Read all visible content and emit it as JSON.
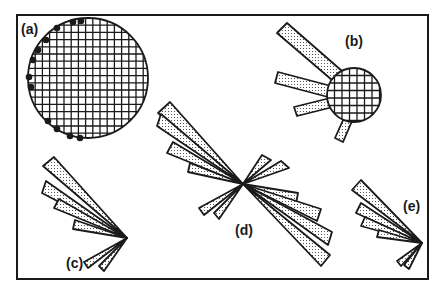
{
  "figure": {
    "frame": {
      "x": 17,
      "y": 15,
      "w": 411,
      "h": 264,
      "stroke": "#1a1a1a"
    },
    "colors": {
      "stroke": "#1a1a1a",
      "fill": "#ffffff",
      "dots": "#1a1a1a",
      "stipple": "#555555"
    },
    "panels": [
      {
        "id": "a",
        "label": "(a)",
        "label_pos": [
          21,
          22
        ],
        "description": "cross-hatched circle with dots along left edge"
      },
      {
        "id": "b",
        "label": "(b)",
        "label_pos": [
          345,
          34
        ],
        "description": "small cross-hatched circle with four stippled bars"
      },
      {
        "id": "c",
        "label": "(c)",
        "label_pos": [
          66,
          256
        ],
        "description": "rose diagram fan of stippled wedges"
      },
      {
        "id": "d",
        "label": "(d)",
        "label_pos": [
          235,
          223
        ],
        "description": "bi-directional rose diagram of stippled wedges"
      },
      {
        "id": "e",
        "label": "(e)",
        "label_pos": [
          403,
          199
        ],
        "description": "rose diagram fan of stippled wedges"
      }
    ],
    "circle_a": {
      "cx": 88,
      "cy": 78,
      "r": 60,
      "grid": 7.2,
      "dots": [
        [
          81,
          21
        ],
        [
          73,
          22
        ],
        [
          57,
          28
        ],
        [
          46,
          40
        ],
        [
          38,
          50
        ],
        [
          33,
          60
        ],
        [
          29,
          77
        ],
        [
          31,
          87
        ],
        [
          48,
          121
        ],
        [
          57,
          129
        ],
        [
          70,
          136
        ],
        [
          80,
          138
        ]
      ]
    },
    "circle_b": {
      "cx": 354,
      "cy": 95,
      "r": 27,
      "grid": 7.5,
      "bars": [
        [
          [
            277,
            33
          ],
          [
            287,
            23
          ],
          [
            342,
            71
          ],
          [
            332,
            80
          ]
        ],
        [
          [
            275,
            83
          ],
          [
            278,
            72
          ],
          [
            331,
            86
          ],
          [
            328,
            97
          ]
        ],
        [
          [
            297,
            116
          ],
          [
            294,
            107
          ],
          [
            330,
            98
          ],
          [
            333,
            107
          ]
        ],
        [
          [
            335,
            138
          ],
          [
            343,
            142
          ],
          [
            352,
            121
          ],
          [
            344,
            118
          ]
        ]
      ]
    },
    "rose_c": {
      "center": [
        127,
        238
      ],
      "wedges": [
        [
          [
            43,
            166
          ],
          [
            54,
            157
          ]
        ],
        [
          [
            42,
            193
          ],
          [
            46,
            181
          ]
        ],
        [
          [
            54,
            208
          ],
          [
            59,
            199
          ]
        ],
        [
          [
            73,
            229
          ],
          [
            75,
            220
          ]
        ],
        [
          [
            84,
            262
          ],
          [
            88,
            268
          ]
        ],
        [
          [
            99,
            266
          ],
          [
            104,
            271
          ]
        ]
      ]
    },
    "rose_d": {
      "center": [
        243,
        184
      ],
      "wedges": [
        [
          [
            158,
            113
          ],
          [
            170,
            102
          ]
        ],
        [
          [
            157,
            126
          ],
          [
            161,
            114
          ]
        ],
        [
          [
            167,
            153
          ],
          [
            173,
            142
          ]
        ],
        [
          [
            188,
            172
          ],
          [
            190,
            163
          ]
        ],
        [
          [
            298,
            193
          ],
          [
            296,
            204
          ]
        ],
        [
          [
            321,
            209
          ],
          [
            317,
            221
          ]
        ],
        [
          [
            332,
            232
          ],
          [
            328,
            245
          ]
        ],
        [
          [
            330,
            255
          ],
          [
            321,
            266
          ]
        ],
        [
          [
            262,
            155
          ],
          [
            271,
            160
          ]
        ],
        [
          [
            281,
            161
          ],
          [
            289,
            168
          ]
        ],
        [
          [
            199,
            208
          ],
          [
            204,
            215
          ]
        ],
        [
          [
            214,
            213
          ],
          [
            219,
            219
          ]
        ]
      ]
    },
    "rose_e": {
      "center": [
        422,
        243
      ],
      "wedges": [
        [
          [
            352,
            190
          ],
          [
            361,
            180
          ]
        ],
        [
          [
            356,
            213
          ],
          [
            361,
            203
          ]
        ],
        [
          [
            361,
            226
          ],
          [
            365,
            217
          ]
        ],
        [
          [
            377,
            237
          ],
          [
            379,
            230
          ]
        ],
        [
          [
            397,
            261
          ],
          [
            401,
            266
          ]
        ],
        [
          [
            404,
            265
          ],
          [
            409,
            269
          ]
        ]
      ]
    }
  }
}
